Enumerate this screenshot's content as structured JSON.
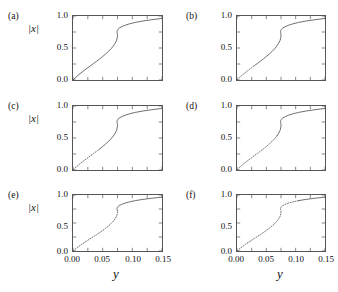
{
  "figure": {
    "axis_label_x": "y",
    "axis_label_y": "|x|",
    "xticks": [
      "0.00",
      "0.05",
      "0.10",
      "0.15"
    ],
    "xtick_values": [
      0.0,
      0.05,
      0.1,
      0.15
    ],
    "yticks": [
      "0.0",
      "0.5",
      "1.0"
    ],
    "ytick_values": [
      0.0,
      0.5,
      1.0
    ],
    "xlim": [
      0.0,
      0.15
    ],
    "ylim": [
      0.0,
      1.0
    ],
    "line_color": "#555555",
    "frame_color": "#555555"
  },
  "panels": [
    {
      "label": "(a)",
      "show_ylabel": true,
      "show_xticks": false
    },
    {
      "label": "(b)",
      "show_ylabel": false,
      "show_xticks": false
    },
    {
      "label": "(c)",
      "show_ylabel": true,
      "show_xticks": false
    },
    {
      "label": "(d)",
      "show_ylabel": false,
      "show_xticks": false
    },
    {
      "label": "(e)",
      "show_ylabel": true,
      "show_xticks": true
    },
    {
      "label": "(f)",
      "show_ylabel": false,
      "show_xticks": true
    }
  ],
  "chart_data": {
    "type": "line",
    "title": "",
    "xlabel": "y",
    "ylabel": "|x|",
    "xlim": [
      0.0,
      0.15
    ],
    "ylim": [
      0.0,
      1.0
    ],
    "grid": false,
    "legend": "none",
    "panels": [
      {
        "name": "(a)",
        "series": [
          {
            "name": "response-curve",
            "style": "solid",
            "x": [
              0.0,
              0.005,
              0.01,
              0.015,
              0.02,
              0.025,
              0.03,
              0.035,
              0.04,
              0.045,
              0.05,
              0.055,
              0.06,
              0.064,
              0.068,
              0.071,
              0.0735,
              0.0745,
              0.075,
              0.0748,
              0.0744,
              0.0742,
              0.0745,
              0.0755,
              0.078,
              0.082,
              0.088,
              0.095,
              0.105,
              0.118,
              0.132,
              0.15
            ],
            "y": [
              0.0,
              0.045,
              0.085,
              0.122,
              0.158,
              0.192,
              0.226,
              0.26,
              0.294,
              0.33,
              0.367,
              0.406,
              0.449,
              0.487,
              0.532,
              0.575,
              0.62,
              0.66,
              0.695,
              0.722,
              0.742,
              0.756,
              0.772,
              0.79,
              0.812,
              0.833,
              0.856,
              0.877,
              0.9,
              0.922,
              0.941,
              0.962
            ]
          }
        ]
      },
      {
        "name": "(b)",
        "series": [
          {
            "name": "unstable-branch",
            "style": "dotted",
            "x": [
              0.0,
              0.005,
              0.01,
              0.015,
              0.02,
              0.025,
              0.03
            ],
            "y": [
              0.0,
              0.045,
              0.085,
              0.122,
              0.158,
              0.192,
              0.226
            ]
          },
          {
            "name": "stable-branch",
            "style": "solid",
            "x": [
              0.03,
              0.035,
              0.04,
              0.045,
              0.05,
              0.055,
              0.06,
              0.064,
              0.068,
              0.071,
              0.0735,
              0.0745,
              0.075,
              0.0748,
              0.0744,
              0.0742,
              0.0745,
              0.0755,
              0.078,
              0.082,
              0.088,
              0.095,
              0.105,
              0.118,
              0.132,
              0.15
            ],
            "y": [
              0.226,
              0.26,
              0.294,
              0.33,
              0.367,
              0.406,
              0.449,
              0.487,
              0.532,
              0.575,
              0.62,
              0.66,
              0.695,
              0.722,
              0.742,
              0.756,
              0.772,
              0.79,
              0.812,
              0.833,
              0.856,
              0.877,
              0.9,
              0.922,
              0.941,
              0.962
            ]
          }
        ]
      },
      {
        "name": "(c)",
        "series": [
          {
            "name": "unstable-branch",
            "style": "dotted",
            "x": [
              0.0,
              0.005,
              0.01,
              0.015,
              0.02,
              0.025,
              0.03,
              0.035,
              0.04,
              0.045
            ],
            "y": [
              0.0,
              0.045,
              0.085,
              0.122,
              0.158,
              0.192,
              0.226,
              0.26,
              0.294,
              0.33
            ]
          },
          {
            "name": "stable-branch",
            "style": "solid",
            "x": [
              0.045,
              0.05,
              0.055,
              0.06,
              0.064,
              0.068,
              0.071,
              0.0735,
              0.0745,
              0.075,
              0.0748,
              0.0744,
              0.0742,
              0.0745,
              0.0755,
              0.078,
              0.082,
              0.088,
              0.095,
              0.105,
              0.118,
              0.132,
              0.15
            ],
            "y": [
              0.33,
              0.367,
              0.406,
              0.449,
              0.487,
              0.532,
              0.575,
              0.62,
              0.66,
              0.695,
              0.722,
              0.742,
              0.756,
              0.772,
              0.79,
              0.812,
              0.833,
              0.856,
              0.877,
              0.9,
              0.922,
              0.941,
              0.962
            ]
          }
        ]
      },
      {
        "name": "(d)",
        "series": [
          {
            "name": "unstable-branch",
            "style": "dotted",
            "x": [
              0.0,
              0.005,
              0.01,
              0.015,
              0.02,
              0.025,
              0.03,
              0.035,
              0.04,
              0.045,
              0.05,
              0.055,
              0.06,
              0.064,
              0.068
            ],
            "y": [
              0.0,
              0.045,
              0.085,
              0.122,
              0.158,
              0.192,
              0.226,
              0.26,
              0.294,
              0.33,
              0.367,
              0.406,
              0.449,
              0.487,
              0.532
            ]
          },
          {
            "name": "stable-branch",
            "style": "solid",
            "x": [
              0.068,
              0.071,
              0.0735,
              0.0745,
              0.075,
              0.0748,
              0.0744,
              0.0742,
              0.0745,
              0.0755,
              0.078,
              0.082,
              0.088,
              0.095,
              0.105,
              0.118,
              0.132,
              0.15
            ],
            "y": [
              0.532,
              0.575,
              0.62,
              0.66,
              0.695,
              0.722,
              0.742,
              0.756,
              0.772,
              0.79,
              0.812,
              0.833,
              0.856,
              0.877,
              0.9,
              0.922,
              0.941,
              0.962
            ]
          }
        ]
      },
      {
        "name": "(e)",
        "series": [
          {
            "name": "unstable-branch",
            "style": "dotted",
            "x": [
              0.0,
              0.005,
              0.01,
              0.015,
              0.02,
              0.025,
              0.03,
              0.035,
              0.04,
              0.045,
              0.05,
              0.055,
              0.06,
              0.064,
              0.068,
              0.071,
              0.0735,
              0.0745,
              0.075,
              0.0748
            ],
            "y": [
              0.0,
              0.045,
              0.085,
              0.122,
              0.158,
              0.192,
              0.226,
              0.26,
              0.294,
              0.33,
              0.367,
              0.406,
              0.449,
              0.487,
              0.532,
              0.575,
              0.62,
              0.66,
              0.695,
              0.722
            ]
          },
          {
            "name": "stable-branch",
            "style": "solid",
            "x": [
              0.0748,
              0.0744,
              0.0742,
              0.0745,
              0.0755,
              0.078,
              0.082,
              0.088,
              0.095,
              0.105,
              0.118,
              0.132,
              0.15
            ],
            "y": [
              0.722,
              0.742,
              0.756,
              0.772,
              0.79,
              0.812,
              0.833,
              0.856,
              0.877,
              0.9,
              0.922,
              0.941,
              0.962
            ]
          }
        ]
      },
      {
        "name": "(f)",
        "series": [
          {
            "name": "unstable-branch",
            "style": "dotted",
            "x": [
              0.0,
              0.005,
              0.01,
              0.015,
              0.02,
              0.025,
              0.03,
              0.035,
              0.04,
              0.045,
              0.05,
              0.055,
              0.06,
              0.064,
              0.068,
              0.071,
              0.0735,
              0.0745,
              0.075,
              0.0748,
              0.0744,
              0.0742,
              0.0745,
              0.0755,
              0.078,
              0.082,
              0.088,
              0.095,
              0.105
            ],
            "y": [
              0.0,
              0.045,
              0.085,
              0.122,
              0.158,
              0.192,
              0.226,
              0.26,
              0.294,
              0.33,
              0.367,
              0.406,
              0.449,
              0.487,
              0.532,
              0.575,
              0.62,
              0.66,
              0.695,
              0.722,
              0.742,
              0.756,
              0.772,
              0.79,
              0.812,
              0.833,
              0.856,
              0.877,
              0.9
            ]
          },
          {
            "name": "stable-branch",
            "style": "solid",
            "x": [
              0.105,
              0.118,
              0.132,
              0.15
            ],
            "y": [
              0.9,
              0.922,
              0.941,
              0.962
            ]
          }
        ]
      }
    ]
  }
}
